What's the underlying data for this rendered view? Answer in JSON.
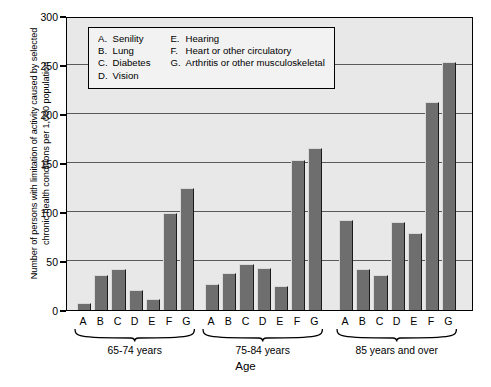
{
  "chart_data": {
    "type": "bar",
    "title": "",
    "xlabel": "Age",
    "ylabel": "Number of persons with limitation of activity caused by selected chronic health conditions per 1,000 population",
    "ylabel_line1": "Number of persons with limitation of activity caused by selected",
    "ylabel_line2": "chronic health conditions per 1,000 population",
    "ylim": [
      0,
      300
    ],
    "yticks": [
      0,
      50,
      100,
      150,
      200,
      250,
      300
    ],
    "grid": true,
    "legend_position": "inside-top-left",
    "categories": [
      "A",
      "B",
      "C",
      "D",
      "E",
      "F",
      "G"
    ],
    "category_names": {
      "A": "Senility",
      "B": "Lung",
      "C": "Diabetes",
      "D": "Vision",
      "E": "Hearing",
      "F": "Heart or other circulatory",
      "G": "Arthritis or other musculoskeletal"
    },
    "groups": [
      "65-74 years",
      "75-84 years",
      "85 years and over"
    ],
    "series": [
      {
        "name": "65-74 years",
        "values": [
          7,
          36,
          42,
          20,
          11,
          99,
          124
        ]
      },
      {
        "name": "75-84 years",
        "values": [
          27,
          38,
          47,
          43,
          24,
          153,
          165
        ]
      },
      {
        "name": "85 years and over",
        "values": [
          92,
          42,
          36,
          90,
          79,
          212,
          253
        ]
      }
    ],
    "bar_color": "#6e6e6e",
    "plot_bg": "#e8e8e8"
  },
  "legend": {
    "left_column": [
      {
        "key": "A.",
        "label": "Senility"
      },
      {
        "key": "B.",
        "label": "Lung"
      },
      {
        "key": "C.",
        "label": "Diabetes"
      },
      {
        "key": "D.",
        "label": "Vision"
      }
    ],
    "right_column": [
      {
        "key": "E.",
        "label": "Hearing"
      },
      {
        "key": "F.",
        "label": "Heart or other circulatory"
      },
      {
        "key": "G.",
        "label": "Arthritis or other musculoskeletal"
      }
    ]
  },
  "axis": {
    "x_title": "Age",
    "y_tick_labels": [
      "300",
      "250",
      "200",
      "150",
      "100",
      "50",
      "0"
    ]
  }
}
